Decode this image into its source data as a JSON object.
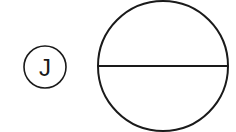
{
  "diagram": {
    "label": {
      "text": "J",
      "shape": "circle",
      "cx": 45,
      "cy": 67,
      "r": 21
    },
    "symbol": {
      "shape": "circle-bisected-horizontal",
      "cx": 163,
      "cy": 66,
      "r": 65
    },
    "colors": {
      "stroke": "#1a1a1a",
      "background": "#ffffff"
    }
  }
}
